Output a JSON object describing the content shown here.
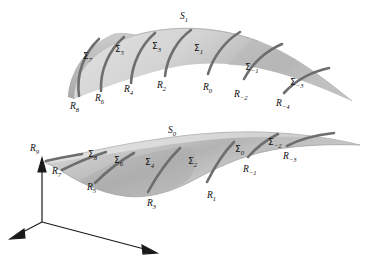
{
  "figure": {
    "background_color": "#fefefe",
    "surface_fill_light": "#d8d8d8",
    "surface_fill_mid": "#c6c6c6",
    "surface_fill_dark": "#b0b0b0",
    "curve_color": "#6e6e6e",
    "axis_color": "#1a1a1a",
    "label_color": "#101010"
  },
  "surfaces": [
    {
      "name": "upper-surface",
      "label": "S",
      "sub": "1"
    },
    {
      "name": "lower-surface",
      "label": "S",
      "sub": "0"
    }
  ],
  "upper": {
    "surface_label": {
      "base": "S",
      "sub": "1",
      "x": 180,
      "y": 12
    },
    "sigma_labels": [
      {
        "base": "Σ",
        "sub": "7",
        "x": 83,
        "y": 52
      },
      {
        "base": "Σ",
        "sub": "5",
        "x": 115,
        "y": 45
      },
      {
        "base": "Σ",
        "sub": "3",
        "x": 152,
        "y": 42
      },
      {
        "base": "Σ",
        "sub": "1",
        "x": 194,
        "y": 44
      },
      {
        "base": "Σ",
        "sub": "−1",
        "x": 245,
        "y": 63
      },
      {
        "base": "Σ",
        "sub": "−3",
        "x": 290,
        "y": 78
      }
    ],
    "r_labels": [
      {
        "base": "R",
        "sub": "8",
        "x": 70,
        "y": 102
      },
      {
        "base": "R",
        "sub": "6",
        "x": 95,
        "y": 94
      },
      {
        "base": "R",
        "sub": "4",
        "x": 124,
        "y": 85
      },
      {
        "base": "R",
        "sub": "2",
        "x": 157,
        "y": 81
      },
      {
        "base": "R",
        "sub": "0",
        "x": 203,
        "y": 83
      },
      {
        "base": "R",
        "sub": "−2",
        "x": 234,
        "y": 90
      },
      {
        "base": "R",
        "sub": "−4",
        "x": 276,
        "y": 99
      }
    ]
  },
  "lower": {
    "surface_label": {
      "base": "S",
      "sub": "0",
      "x": 168,
      "y": 126
    },
    "sigma_labels": [
      {
        "base": "Σ",
        "sub": "8",
        "x": 88,
        "y": 150
      },
      {
        "base": "Σ",
        "sub": "6",
        "x": 114,
        "y": 156
      },
      {
        "base": "Σ",
        "sub": "4",
        "x": 145,
        "y": 158
      },
      {
        "base": "Σ",
        "sub": "2",
        "x": 188,
        "y": 157
      },
      {
        "base": "Σ",
        "sub": "0",
        "x": 235,
        "y": 145
      },
      {
        "base": "Σ",
        "sub": "−2",
        "x": 268,
        "y": 138
      }
    ],
    "r_labels": [
      {
        "base": "R",
        "sub": "9",
        "x": 30,
        "y": 144
      },
      {
        "base": "R",
        "sub": "7",
        "x": 52,
        "y": 167
      },
      {
        "base": "R",
        "sub": "5",
        "x": 87,
        "y": 183
      },
      {
        "base": "R",
        "sub": "3",
        "x": 147,
        "y": 199
      },
      {
        "base": "R",
        "sub": "1",
        "x": 207,
        "y": 191
      },
      {
        "base": "R",
        "sub": "−1",
        "x": 243,
        "y": 165
      },
      {
        "base": "R",
        "sub": "−3",
        "x": 283,
        "y": 152
      }
    ]
  },
  "axes": {
    "name": "coordinate-axes",
    "origin": {
      "x": 42,
      "y": 222
    },
    "vertical_tip": {
      "x": 42,
      "y": 160
    },
    "left_tip": {
      "x": 11,
      "y": 238
    },
    "right_tip": {
      "x": 156,
      "y": 254
    }
  }
}
